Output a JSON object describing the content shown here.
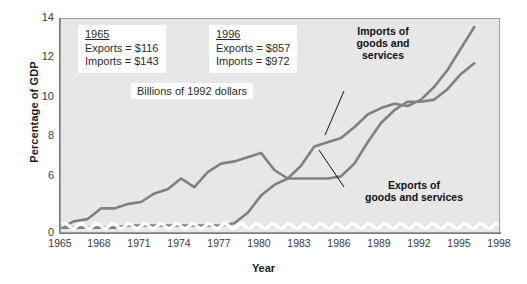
{
  "chart_data": {
    "type": "line",
    "title": "",
    "xlabel": "Year",
    "ylabel": "Percentage of GDP",
    "xlim": [
      1965,
      1998
    ],
    "ylim": [
      4.3,
      14
    ],
    "yticks": [
      14,
      12,
      10,
      8,
      6,
      0
    ],
    "xticks": [
      1965,
      1968,
      1971,
      1974,
      1977,
      1980,
      1983,
      1986,
      1989,
      1992,
      1995,
      1998
    ],
    "axis_break": true,
    "axis_break_note": "y-axis broken between 0 and ~4.3",
    "grid": false,
    "legend": "annotations on lines",
    "x": [
      1965,
      1966,
      1967,
      1968,
      1969,
      1970,
      1971,
      1972,
      1973,
      1974,
      1975,
      1976,
      1977,
      1978,
      1979,
      1980,
      1981,
      1982,
      1983,
      1984,
      1985,
      1986,
      1987,
      1988,
      1989,
      1990,
      1991,
      1992,
      1993,
      1994,
      1995,
      1996
    ],
    "series": [
      {
        "name": "Imports of goods and services",
        "color": "#808080",
        "values": [
          4.6,
          4.9,
          5.0,
          5.5,
          5.5,
          5.7,
          5.8,
          6.2,
          6.4,
          6.9,
          6.5,
          7.2,
          7.6,
          7.7,
          7.9,
          8.1,
          7.3,
          6.9,
          7.5,
          8.4,
          8.6,
          8.8,
          9.3,
          9.9,
          10.2,
          10.4,
          10.3,
          10.6,
          11.2,
          12.0,
          13.0,
          14.0
        ]
      },
      {
        "name": "Exports of goods and services",
        "color": "#808080",
        "values": [
          4.6,
          4.6,
          4.6,
          4.6,
          4.6,
          4.7,
          4.7,
          4.7,
          4.7,
          4.7,
          4.7,
          4.7,
          4.7,
          4.8,
          5.3,
          6.1,
          6.6,
          6.9,
          6.9,
          6.9,
          6.9,
          7.0,
          7.6,
          8.6,
          9.5,
          10.1,
          10.5,
          10.5,
          10.6,
          11.1,
          11.8,
          12.3
        ]
      }
    ]
  },
  "axes": {
    "ylabel": "Percentage of GDP",
    "xlabel": "Year",
    "ytick_labels": [
      "14",
      "12",
      "10",
      "8",
      "6",
      "0"
    ],
    "xtick_labels": [
      "1965",
      "1968",
      "1971",
      "1974",
      "1977",
      "1980",
      "1983",
      "1986",
      "1989",
      "1992",
      "1995",
      "1998"
    ]
  },
  "annotations": {
    "box_1965": {
      "year": "1965",
      "exports": "Exports = $116",
      "imports": "Imports = $143"
    },
    "box_1996": {
      "year": "1996",
      "exports": "Exports = $857",
      "imports": "Imports = $972"
    },
    "units_caption": "Billions of 1992 dollars",
    "imports_label": "Imports of\ngoods and\nservices",
    "exports_label": "Exports of\ngoods and services"
  },
  "colors": {
    "plot_background": "#e7e7e7",
    "line": "#808080",
    "axis": "#7d7d7d",
    "text": "#1a1a1a",
    "box_background": "#ffffff"
  }
}
